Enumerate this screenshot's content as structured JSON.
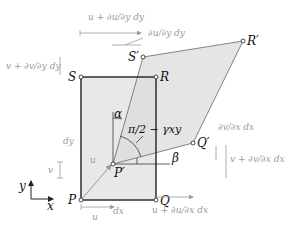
{
  "figure": {
    "type": "strain-deformation-diagram",
    "points": {
      "P": "P",
      "Q": "Q",
      "R": "R",
      "S": "S",
      "P_prime": "P′",
      "Q_prime": "Q′",
      "R_prime": "R′",
      "S_prime": "S′"
    },
    "angles": {
      "alpha": "α",
      "beta": "β",
      "right_angle_minus_shear": "π/2 − γxy"
    },
    "dimensions": {
      "dx": "dx",
      "dy": "dy",
      "u": "u",
      "v": "v"
    },
    "displacement_labels": {
      "top_u": "u + ∂u/∂y dy",
      "top_du": "∂u/∂y dy",
      "left_v": "v + ∂v/∂y dy",
      "right_dv": "∂v/∂x dx",
      "right_v": "v + ∂v/∂x dx",
      "bottom_u": "u + ∂u/∂x dx",
      "bottom_plain_u": "u",
      "v_small": "v",
      "u_arrow": "u"
    },
    "axes": {
      "x": "x",
      "y": "y"
    },
    "colors": {
      "undeformed_fill": "#e6e6e6",
      "deformed_fill": "#e3e3e3",
      "line": "#222222",
      "annotation": "#9a9a9a"
    }
  }
}
